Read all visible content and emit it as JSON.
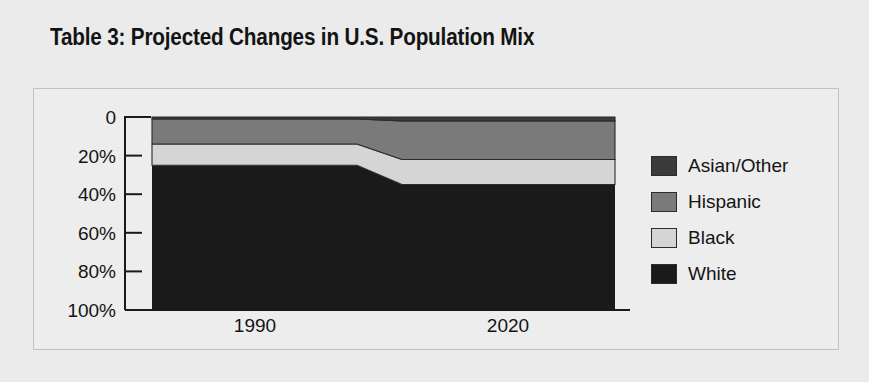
{
  "figure": {
    "title": "Table 3: Projected Changes in U.S. Population Mix",
    "background_color": "#ebebeb",
    "panel_border_color": "#c2c2c2"
  },
  "legend": {
    "position": "right",
    "items": [
      {
        "label": "Asian/Other",
        "color": "#3a3a3a",
        "swatch_name": "legend-swatch-asian-other"
      },
      {
        "label": "Hispanic",
        "color": "#7a7a7a",
        "swatch_name": "legend-swatch-hispanic"
      },
      {
        "label": "Black",
        "color": "#d5d5d5",
        "swatch_name": "legend-swatch-black"
      },
      {
        "label": "White",
        "color": "#1a1a1a",
        "swatch_name": "legend-swatch-white"
      }
    ]
  },
  "axes": {
    "y_ticks": [
      "100%",
      "80%",
      "60%",
      "40%",
      "20%",
      "0"
    ],
    "y_tick_values": [
      100,
      80,
      60,
      40,
      20,
      0
    ],
    "x_ticks": [
      "1990",
      "2020"
    ]
  },
  "chart_data": {
    "type": "area",
    "title": "Table 3: Projected Changes in U.S. Population Mix",
    "subtitle": "",
    "xlabel": "",
    "ylabel": "",
    "categories": [
      "1990",
      "2020"
    ],
    "x": [
      1990,
      2020
    ],
    "ylim": [
      0,
      100
    ],
    "yticks": [
      0,
      20,
      40,
      60,
      80,
      100
    ],
    "ytick_labels": [
      "0",
      "20%",
      "40%",
      "60%",
      "80%",
      "100%"
    ],
    "grid": false,
    "stacked": true,
    "stack_order_bottom_to_top": [
      "White",
      "Black",
      "Hispanic",
      "Asian/Other"
    ],
    "legend_position": "right",
    "series": [
      {
        "name": "White",
        "color": "#1a1a1a",
        "values": [
          75,
          65
        ]
      },
      {
        "name": "Black",
        "color": "#d5d5d5",
        "values": [
          11,
          13
        ]
      },
      {
        "name": "Hispanic",
        "color": "#7a7a7a",
        "values": [
          13,
          20
        ]
      },
      {
        "name": "Asian/Other",
        "color": "#3a3a3a",
        "values": [
          1,
          2
        ]
      }
    ],
    "cumulative_tops": {
      "1990": {
        "White": 75,
        "Black": 86,
        "Hispanic": 99,
        "Asian/Other": 100
      },
      "2020": {
        "White": 65,
        "Black": 78,
        "Hispanic": 98,
        "Asian/Other": 100
      }
    }
  },
  "geometry": {
    "plot_left": 152,
    "plot_right": 615,
    "plateau_1990_right": 357,
    "plateau_2020_left": 402,
    "y_top_100": 117,
    "y_bottom_0": 310,
    "axis_x": 125,
    "tick_1990_x": 255,
    "tick_2020_x": 508,
    "label_y": 332
  }
}
